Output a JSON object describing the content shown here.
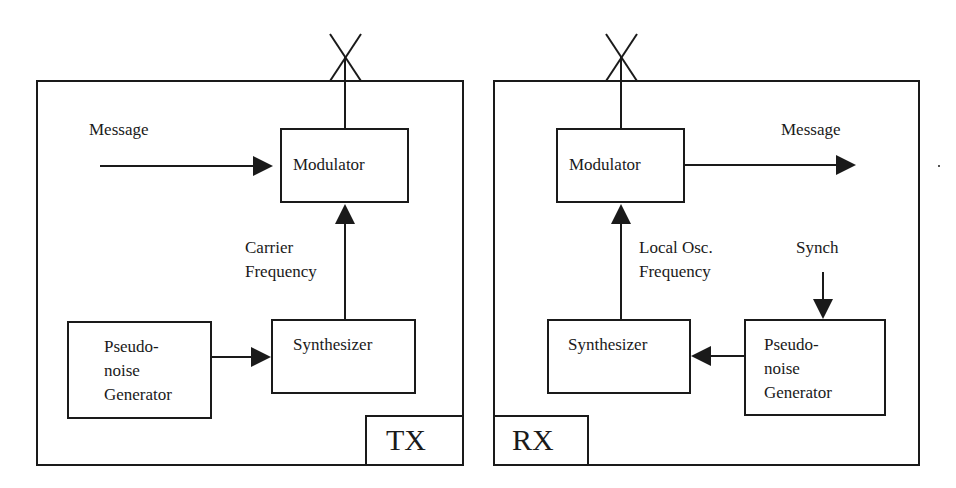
{
  "diagram": {
    "tx": {
      "label": "TX",
      "input_label": "Message",
      "modulator": "Modulator",
      "carrier_line1": "Carrier",
      "carrier_line2": "Frequency",
      "synthesizer": "Synthesizer",
      "pn_line1": "Pseudo-",
      "pn_line2": "noise",
      "pn_line3": "Generator"
    },
    "rx": {
      "label": "RX",
      "output_label": "Message",
      "modulator": "Modulator",
      "lo_line1": "Local Osc.",
      "lo_line2": "Frequency",
      "synch": "Synch",
      "synthesizer": "Synthesizer",
      "pn_line1": "Pseudo-",
      "pn_line2": "noise",
      "pn_line3": "Generator"
    },
    "colors": {
      "stroke": "#1a1a1a",
      "background": "#ffffff"
    }
  }
}
